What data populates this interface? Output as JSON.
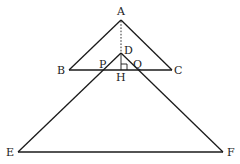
{
  "diagram": {
    "type": "geometry",
    "points": {
      "A": {
        "label": "A"
      },
      "B": {
        "label": "B"
      },
      "C": {
        "label": "C"
      },
      "D": {
        "label": "D"
      },
      "E": {
        "label": "E"
      },
      "F": {
        "label": "F"
      },
      "P": {
        "label": "P"
      },
      "Q": {
        "label": "Q"
      },
      "H": {
        "label": "H"
      }
    },
    "segments": [
      [
        "A",
        "B"
      ],
      [
        "A",
        "C"
      ],
      [
        "B",
        "C"
      ],
      [
        "D",
        "E"
      ],
      [
        "D",
        "F"
      ],
      [
        "E",
        "F"
      ]
    ],
    "dashed_segments": [
      [
        "A",
        "H"
      ]
    ],
    "right_angle_at": "H"
  }
}
